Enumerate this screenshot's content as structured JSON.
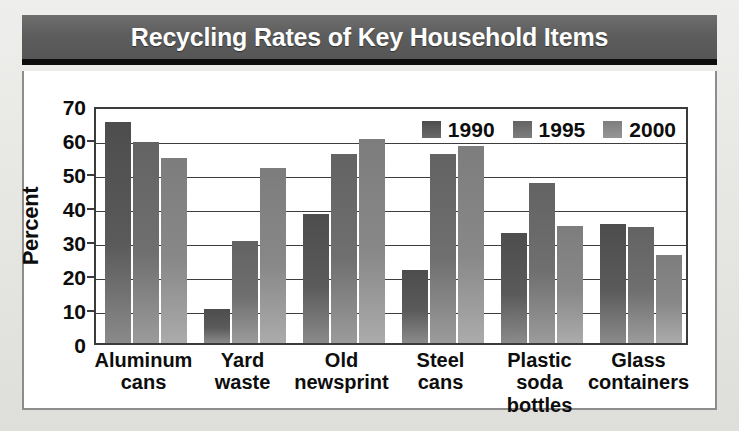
{
  "chart_data": {
    "type": "bar",
    "title": "Recycling Rates of Key Household Items",
    "xlabel": "",
    "ylabel": "Percent",
    "ylim": [
      0,
      70
    ],
    "ytick_step": 10,
    "yticks": [
      "70",
      "60",
      "50",
      "40",
      "30",
      "20",
      "10",
      "0"
    ],
    "grid": true,
    "legend_position": "top-right inside plot",
    "categories": [
      "Aluminum\ncans",
      "Yard\nwaste",
      "Old\nnewsprint",
      "Steel\ncans",
      "Plastic soda\nbottles",
      "Glass\ncontainers"
    ],
    "series": [
      {
        "name": "1990",
        "color": "#555555",
        "values": [
          65,
          10,
          38,
          21.5,
          32.5,
          35
        ]
      },
      {
        "name": "1995",
        "color": "#6e6e6e",
        "values": [
          59,
          30,
          55.5,
          55.5,
          47,
          34
        ]
      },
      {
        "name": "2000",
        "color": "#8a8a8a",
        "values": [
          54.5,
          51.5,
          60,
          58,
          34.5,
          26
        ]
      }
    ]
  },
  "figure": {
    "title": "Recycling Rates of Key Household Items",
    "axis_label_y": "Percent"
  },
  "legend": {
    "items": [
      {
        "label": "1990"
      },
      {
        "label": "1995"
      },
      {
        "label": "2000"
      }
    ]
  }
}
